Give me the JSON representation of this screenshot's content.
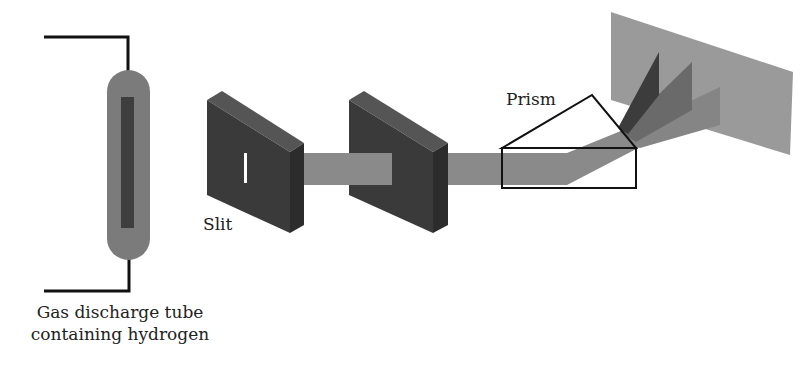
{
  "diagram": {
    "labels": {
      "tube_line1": "Gas discharge tube",
      "tube_line2": "containing hydrogen",
      "slit": "Slit",
      "prism": "Prism"
    },
    "components": [
      {
        "id": "discharge-tube",
        "label": "Gas discharge tube containing hydrogen"
      },
      {
        "id": "slit-plate",
        "label": "Slit"
      },
      {
        "id": "aperture-plate",
        "label": ""
      },
      {
        "id": "prism",
        "label": "Prism"
      },
      {
        "id": "screen",
        "label": ""
      }
    ],
    "colors": {
      "tube_body": "#7b7b7b",
      "tube_core": "#3e3e3e",
      "plate_front": "#3a3a3a",
      "plate_top": "#555555",
      "plate_side": "#2c2c2c",
      "beam": "#8a8a8a",
      "screen": "#9a9a9a",
      "ray_dark": "#3c3c3c",
      "ray_mid": "#6a6a6a",
      "ray_light": "#858585",
      "wire": "#111111",
      "slit_opening": "#ffffff"
    }
  }
}
